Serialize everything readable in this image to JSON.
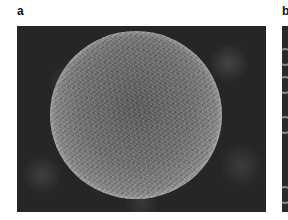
{
  "figure": {
    "panels": [
      {
        "label": "a",
        "description": "SEM micrograph of a spherical particle with textured surface on dark background"
      },
      {
        "label": "b",
        "description": "Partially visible micrograph with ring-like structures"
      }
    ]
  }
}
